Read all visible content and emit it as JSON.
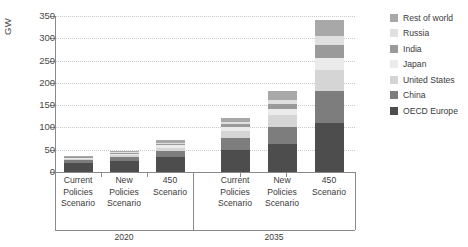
{
  "chart_data": {
    "type": "bar",
    "subtype": "stacked-bar",
    "title": "",
    "xlabel": "",
    "ylabel": "GW",
    "ylim": [
      0,
      350
    ],
    "yticks": [
      0,
      50,
      100,
      150,
      200,
      250,
      300,
      350
    ],
    "ytick_labels": [
      "0",
      "50",
      "100",
      "150",
      "200",
      "250",
      "300",
      "350"
    ],
    "grid": true,
    "grid_axis": "y",
    "legend_position": "right",
    "groups": [
      {
        "label": "2020",
        "categories": [
          "Current\nPolicies\nScenario",
          "New\nPolicies\nScenario",
          "450\nScenario"
        ]
      },
      {
        "label": "2035",
        "categories": [
          "Current\nPolicies\nScenario",
          "New\nPolicies\nScenario",
          "450\nScenario"
        ]
      }
    ],
    "categories": [
      "Current Policies Scenario 2020",
      "New Policies Scenario 2020",
      "450 Scenario 2020",
      "Current Policies Scenario 2035",
      "New Policies Scenario 2035",
      "450 Scenario 2035"
    ],
    "series": [
      {
        "name": "OECD Europe",
        "color": "#4d4d4d",
        "values": [
          20,
          24,
          33,
          50,
          62,
          110
        ]
      },
      {
        "name": "China",
        "color": "#7d7d7d",
        "values": [
          6,
          9,
          14,
          26,
          40,
          72
        ]
      },
      {
        "name": "United States",
        "color": "#d5d5d5",
        "values": [
          4,
          5,
          8,
          16,
          26,
          48
        ]
      },
      {
        "name": "Japan",
        "color": "#ebebeb",
        "values": [
          2,
          3,
          5,
          8,
          13,
          26
        ]
      },
      {
        "name": "India",
        "color": "#9a9a9a",
        "values": [
          1,
          2,
          4,
          7,
          12,
          30
        ]
      },
      {
        "name": "Russia",
        "color": "#e0e0e0",
        "values": [
          1,
          1,
          2,
          5,
          9,
          20
        ]
      },
      {
        "name": "Rest of world",
        "color": "#a8a8a8",
        "values": [
          2,
          3,
          5,
          10,
          19,
          36
        ]
      }
    ],
    "legend_entries": [
      {
        "label": "Rest of world",
        "color": "#a8a8a8"
      },
      {
        "label": "Russia",
        "color": "#e0e0e0"
      },
      {
        "label": "India",
        "color": "#9a9a9a"
      },
      {
        "label": "Japan",
        "color": "#ebebeb"
      },
      {
        "label": "United States",
        "color": "#d5d5d5"
      },
      {
        "label": "China",
        "color": "#7d7d7d"
      },
      {
        "label": "OECD Europe",
        "color": "#4d4d4d"
      }
    ],
    "totals": [
      36,
      47,
      71,
      122,
      181,
      342
    ]
  },
  "axis": {
    "y_title": "GW"
  },
  "colors": {
    "axis": "#8a8a8a",
    "grid": "#c9c9c9",
    "text": "#3a3a3a",
    "background": "#ffffff"
  }
}
